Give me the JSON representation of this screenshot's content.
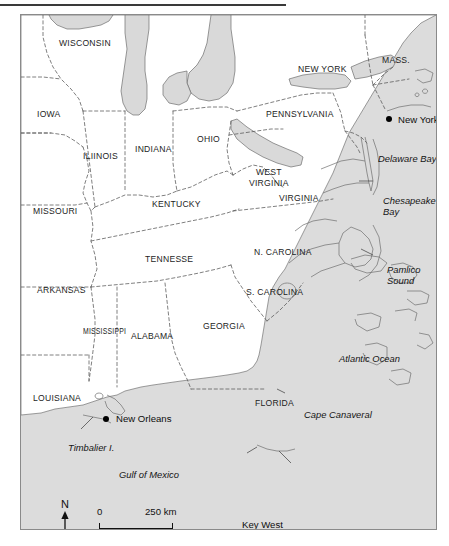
{
  "figure": {
    "width": 449,
    "height": 546,
    "frame_color": "#8a8a8a",
    "land_color": "#ffffff",
    "ocean_color": "#dcdcdc",
    "lake_color": "#d9d9d9",
    "border_style": "dashed",
    "rule_color": "#3a3a3a"
  },
  "states": [
    {
      "label": "WISCONSIN",
      "x": 38,
      "y": 24
    },
    {
      "label": "IOWA",
      "x": 16,
      "y": 95
    },
    {
      "label": "ILIINOIS",
      "x": 62,
      "y": 137
    },
    {
      "label": "INDIANA",
      "x": 114,
      "y": 130
    },
    {
      "label": "OHIO",
      "x": 176,
      "y": 120
    },
    {
      "label": "MISSOURI",
      "x": 12,
      "y": 192
    },
    {
      "label": "KENTUCKY",
      "x": 131,
      "y": 185
    },
    {
      "label": "TENNESSE",
      "x": 124,
      "y": 240
    },
    {
      "label": "ARKANSAS",
      "x": 16,
      "y": 271
    },
    {
      "label": "MISSISSIPPI",
      "x": 62,
      "y": 312
    },
    {
      "label": "ALABAMA",
      "x": 110,
      "y": 317
    },
    {
      "label": "GEORGIA",
      "x": 182,
      "y": 307
    },
    {
      "label": "LOUISIANA",
      "x": 12,
      "y": 379
    },
    {
      "label": "FLORIDA",
      "x": 234,
      "y": 384
    },
    {
      "label": "NEW YORK",
      "x": 277,
      "y": 50
    },
    {
      "label": "MASS.",
      "x": 361,
      "y": 41
    },
    {
      "label": "PENNSYLVANIA",
      "x": 245,
      "y": 95
    },
    {
      "label": "VIRGINIA",
      "x": 258,
      "y": 179
    },
    {
      "label": "N. CAROLINA",
      "x": 233,
      "y": 233
    },
    {
      "label": "S. CAROLINA",
      "x": 225,
      "y": 273
    }
  ],
  "states_multiline": [
    {
      "line1": "WEST",
      "line2": "VIRGINIA",
      "x": 228,
      "y": 157
    }
  ],
  "water_labels": [
    {
      "label": "Delaware Bay",
      "x": 357,
      "y": 139
    },
    {
      "label": "Atlantic Ocean",
      "x": 318,
      "y": 339
    },
    {
      "label": "Gulf of Mexico",
      "x": 98,
      "y": 455
    },
    {
      "label": "Cape Canaveral",
      "x": 283,
      "y": 395
    },
    {
      "label": "Florida Keys",
      "x": 303,
      "y": 518
    },
    {
      "label": "Timbalier I.",
      "x": 47,
      "y": 428
    }
  ],
  "water_labels_multiline": [
    {
      "line1": "Chesapeake",
      "line2": "Bay",
      "x": 362,
      "y": 180
    },
    {
      "line1": "Pamlico",
      "line2": "Sound",
      "x": 366,
      "y": 249
    }
  ],
  "cities": [
    {
      "label": "New York",
      "dot_x": 368,
      "dot_y": 104,
      "label_x": 377,
      "label_y": 100
    },
    {
      "label": "New Orleans",
      "dot_x": 85,
      "dot_y": 404,
      "label_x": 95,
      "label_y": 399
    },
    {
      "label": "Key West",
      "dot_x": null,
      "dot_y": null,
      "label_x": 240,
      "label_y": 505
    }
  ],
  "scale": {
    "zero_label": "0",
    "max_label": "250 km",
    "bar_left": 78,
    "bar_width": 74
  },
  "north_arrow": {
    "label": "N"
  }
}
